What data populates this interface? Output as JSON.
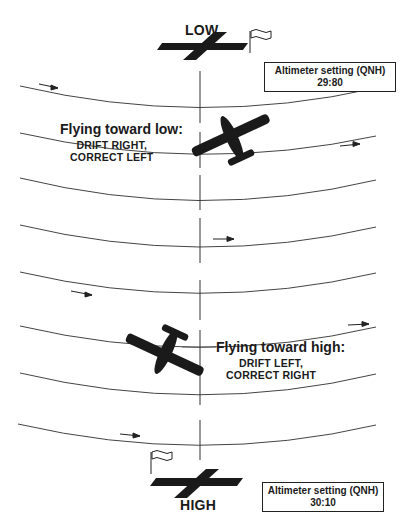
{
  "diagram": {
    "top_pole": {
      "label": "LOW"
    },
    "bottom_pole": {
      "label": "HIGH"
    },
    "altimeter_low": {
      "title": "Altimeter setting (QNH)",
      "value": "29:80"
    },
    "altimeter_high": {
      "title": "Altimeter setting (QNH)",
      "value": "30:10"
    },
    "flying_low": {
      "heading": "Flying toward low:",
      "line1": "DRIFT RIGHT,",
      "line2": "CORRECT LEFT"
    },
    "flying_high": {
      "heading": "Flying toward high:",
      "line1": "DRIFT LEFT,",
      "line2": "CORRECT RIGHT"
    },
    "isobar_count": 8,
    "wind_arrows_direction": "left-to-right",
    "colors": {
      "ink": "#1a1a1a",
      "line": "#444444",
      "background": "#ffffff"
    }
  }
}
